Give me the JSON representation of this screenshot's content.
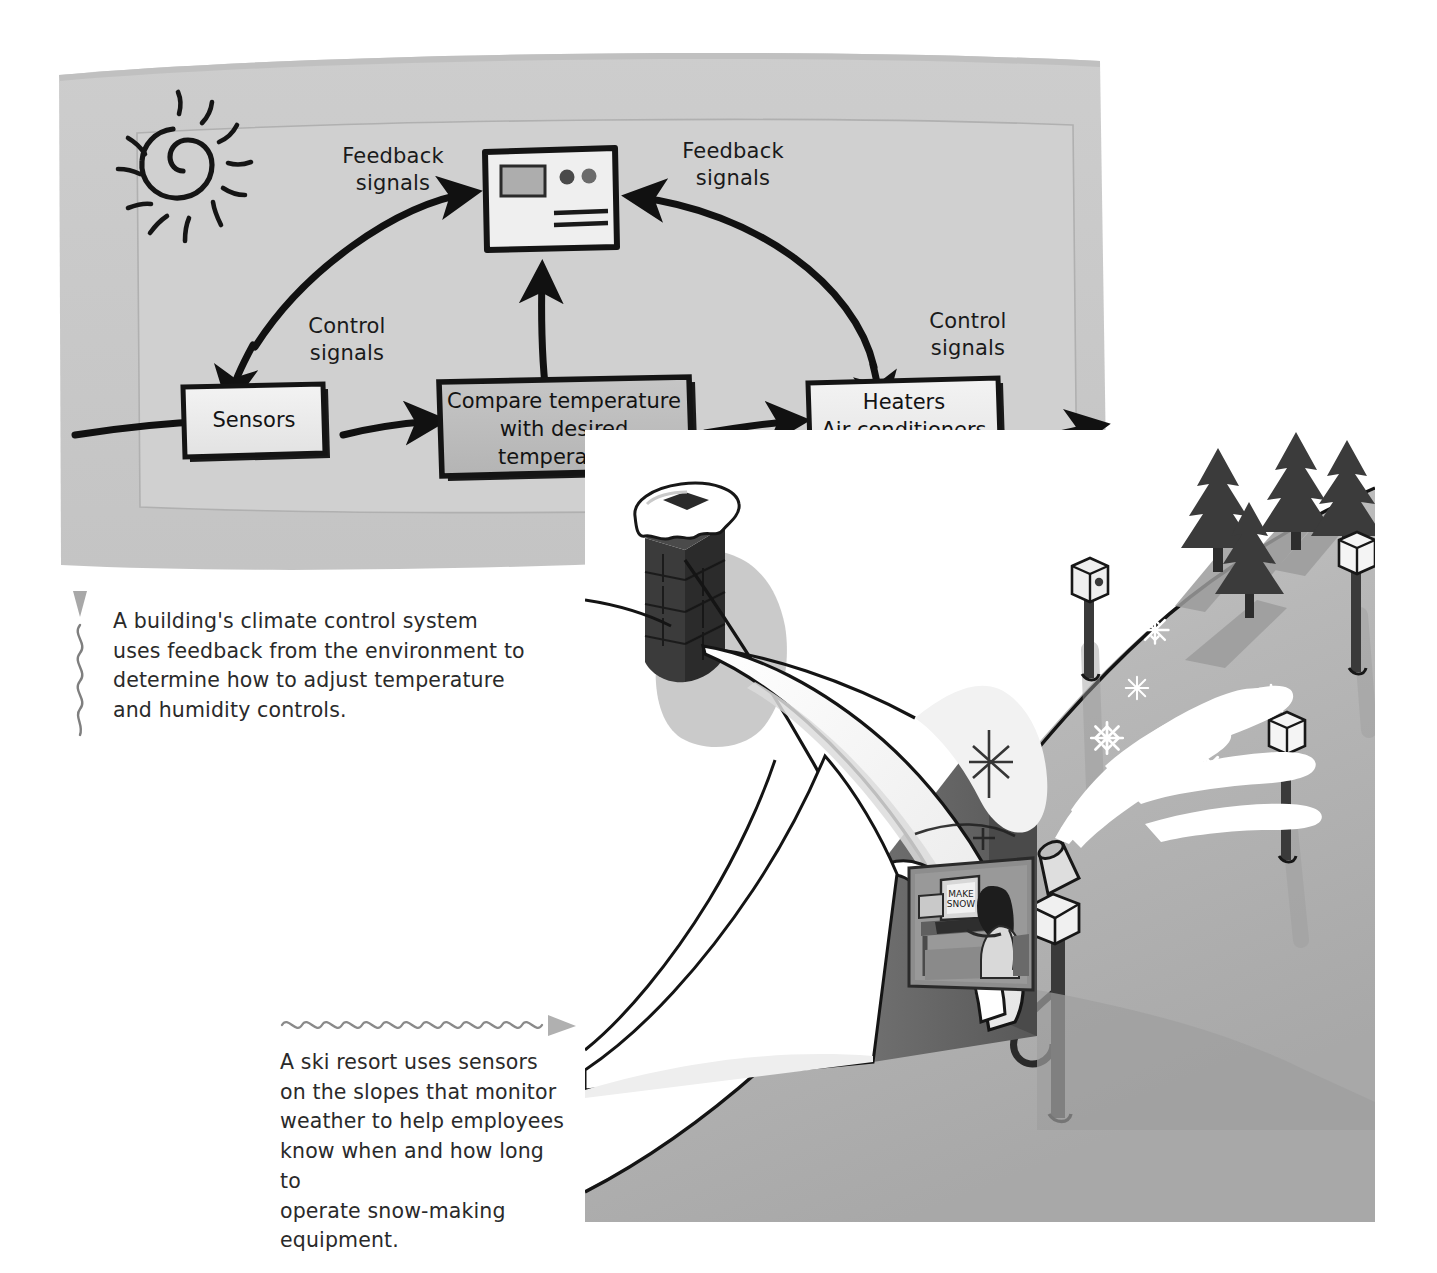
{
  "page": {
    "background": "#ffffff",
    "width": 1437,
    "height": 1273
  },
  "diagram": {
    "title_hidden": "",
    "panel_color": "#c9c9c9",
    "panel_inner_color": "#d2d2d2",
    "icons": {
      "sun": "sun-icon",
      "thermostat": "thermostat-icon"
    },
    "labels": {
      "feedback_left_line1": "Feedback",
      "feedback_left_line2": "signals",
      "feedback_right_line1": "Feedback",
      "feedback_right_line2": "signals",
      "control_left_line1": "Control",
      "control_left_line2": "signals",
      "control_right_line1": "Control",
      "control_right_line2": "signals"
    },
    "boxes": [
      {
        "id": "sensors",
        "label": "Sensors",
        "fill": "#e8e8e8"
      },
      {
        "id": "compare",
        "label_line1": "Compare temperature",
        "label_line2": "with desired",
        "label_line3": "temperature",
        "fill": "#bdbdbd"
      },
      {
        "id": "effectors",
        "label_line1": "Heaters",
        "label_line2": "Air conditioners",
        "label_line3": "Humidifiers",
        "fill": "#ededed"
      }
    ]
  },
  "captions": {
    "climate": {
      "marker": "wavy-line-up-arrow-marker",
      "line1": "A building's climate control system",
      "line2": "uses feedback from the environment to",
      "line3": "determine how to adjust temperature",
      "line4": "and humidity controls."
    },
    "ski": {
      "marker": "wavy-line-right-arrow-marker",
      "line1": "A ski resort uses sensors",
      "line2": "on the slopes that monitor",
      "line3": "weather to help employees",
      "line4": "know when and how long to",
      "line5": "operate snow-making",
      "line6": "equipment."
    }
  },
  "ski_art": {
    "background": "#b2b2b2",
    "snow_color": "#ffffff",
    "elements": [
      "ski-lodge",
      "chimney",
      "snow-covered-roof",
      "pine-trees",
      "sensor-post",
      "snow-making-machine",
      "snowflake",
      "person-at-computer"
    ],
    "monitor_text_line1": "MAKE",
    "monitor_text_line2": "SNOW"
  }
}
